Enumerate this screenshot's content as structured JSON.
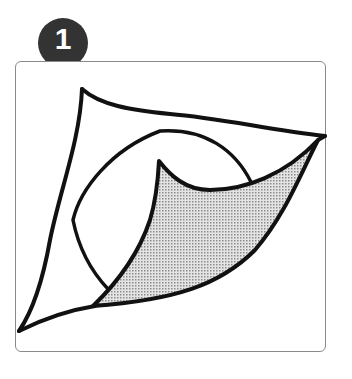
{
  "step": {
    "number": "1",
    "badge_color": "#333333",
    "number_color": "#ffffff"
  },
  "figure": {
    "stroke_color": "#111111",
    "shade_color": "#bdbdbd",
    "frame_border_color": "#8a8a8a"
  },
  "caption": {
    "text": ""
  }
}
